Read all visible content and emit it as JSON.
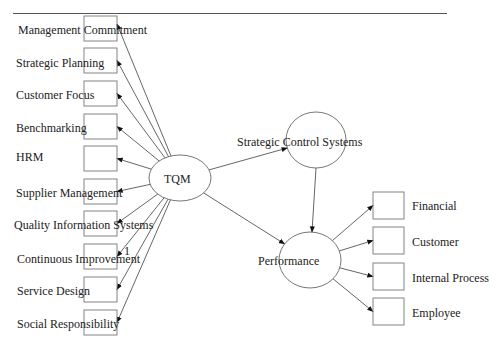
{
  "diagram": {
    "type": "structural-equation-model",
    "center_node": {
      "label": "TQM",
      "cx": 180,
      "cy": 178,
      "rx": 31,
      "ry": 23
    },
    "tqm_indicators": [
      {
        "label": "Management Commitment",
        "box_y": 16
      },
      {
        "label": "Strategic Planning",
        "box_y": 48
      },
      {
        "label": "Customer Focus",
        "box_y": 81
      },
      {
        "label": "Benchmarking",
        "box_y": 114
      },
      {
        "label": "HRM",
        "box_y": 146
      },
      {
        "label": "Supplier Management",
        "box_y": 179
      },
      {
        "label": "Quality Information Systems",
        "box_y": 211
      },
      {
        "label": "Continuous Improvement",
        "box_y": 244
      },
      {
        "label": "Service Design",
        "box_y": 277
      },
      {
        "label": "Social Responsibility",
        "box_y": 310
      }
    ],
    "path_label": "1",
    "strategic_node": {
      "label": "Strategic Control Systems",
      "cx": 316,
      "cy": 140,
      "rx": 30,
      "ry": 28
    },
    "performance_node": {
      "label": "Performance",
      "cx": 310,
      "cy": 260,
      "rx": 31,
      "ry": 28
    },
    "performance_indicators": [
      {
        "label": "Financial",
        "box_y": 192
      },
      {
        "label": "Customer",
        "box_y": 227
      },
      {
        "label": "Internal Process",
        "box_y": 263
      },
      {
        "label": "Employee",
        "box_y": 298
      }
    ],
    "colors": {
      "line": "#555555",
      "text": "#222222",
      "arrow": "#111111"
    }
  }
}
